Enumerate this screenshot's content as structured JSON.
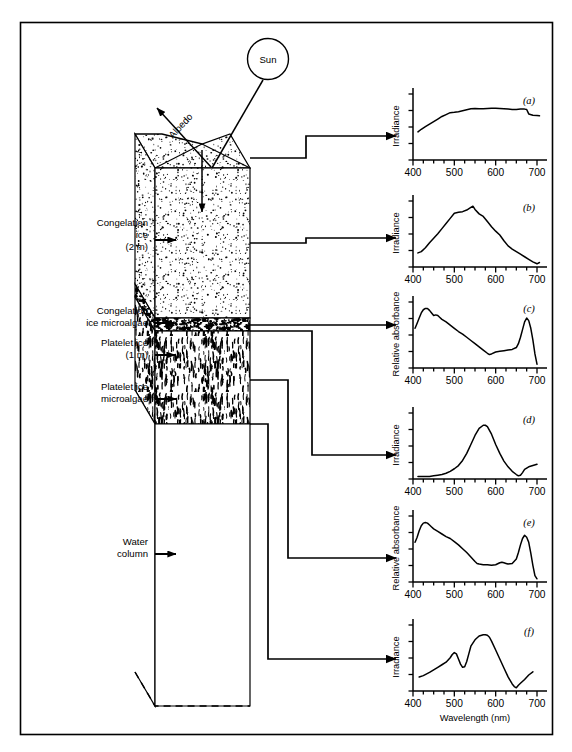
{
  "figure": {
    "border_color": "#000000",
    "background": "#ffffff"
  },
  "diagram": {
    "sun_label": "Sun",
    "albedo_label": "Albedo",
    "layers": [
      {
        "id": "congelation-ice",
        "line1": "Congelation",
        "line2": "ice",
        "line3": "(2 m)"
      },
      {
        "id": "congelation-ice-microalgae",
        "line1": "Congelation",
        "line2": "ice microalgae",
        "line3": ""
      },
      {
        "id": "platelet-ice",
        "line1": "Platelet ice",
        "line2": "(1 m)",
        "line3": ""
      },
      {
        "id": "platelet-ice-microalgae",
        "line1": "Platelet ice",
        "line2": "microalgae",
        "line3": ""
      },
      {
        "id": "water-column",
        "line1": "Water",
        "line2": "column",
        "line3": ""
      }
    ]
  },
  "axis": {
    "xlabel": "Wavelength (nm)",
    "xticks": [
      400,
      500,
      600,
      700
    ],
    "xtick_labels": [
      "400",
      "500",
      "600",
      "700"
    ],
    "xlim": [
      400,
      710
    ],
    "minor_tick_step": 25
  },
  "chart_data": [
    {
      "id": "a",
      "type": "line",
      "panel_label": "(a)",
      "ylabel": "Irradiance",
      "xlabel": "Wavelength (nm)",
      "xlim": [
        400,
        710
      ],
      "ylim": [
        0,
        1
      ],
      "grid": false,
      "legend": "none",
      "x": [
        412,
        420,
        430,
        440,
        450,
        460,
        470,
        480,
        490,
        500,
        510,
        520,
        530,
        540,
        550,
        560,
        570,
        580,
        590,
        600,
        610,
        620,
        630,
        640,
        650,
        660,
        670,
        675,
        680,
        690,
        700,
        706
      ],
      "y": [
        0.44,
        0.48,
        0.52,
        0.56,
        0.6,
        0.64,
        0.68,
        0.71,
        0.74,
        0.745,
        0.755,
        0.77,
        0.785,
        0.8,
        0.805,
        0.8,
        0.8,
        0.805,
        0.81,
        0.81,
        0.805,
        0.8,
        0.795,
        0.79,
        0.79,
        0.795,
        0.795,
        0.79,
        0.72,
        0.7,
        0.695,
        0.69
      ]
    },
    {
      "id": "b",
      "type": "line",
      "panel_label": "(b)",
      "ylabel": "Irradiance",
      "xlabel": "Wavelength (nm)",
      "xlim": [
        400,
        710
      ],
      "ylim": [
        0,
        1
      ],
      "grid": false,
      "legend": "none",
      "x": [
        412,
        420,
        430,
        440,
        450,
        460,
        470,
        480,
        490,
        500,
        510,
        520,
        530,
        540,
        545,
        550,
        560,
        570,
        580,
        590,
        600,
        610,
        620,
        630,
        640,
        650,
        660,
        670,
        680,
        690,
        700,
        706
      ],
      "y": [
        0.22,
        0.24,
        0.3,
        0.38,
        0.45,
        0.52,
        0.6,
        0.68,
        0.76,
        0.84,
        0.855,
        0.865,
        0.89,
        0.93,
        0.95,
        0.9,
        0.83,
        0.79,
        0.71,
        0.63,
        0.56,
        0.5,
        0.41,
        0.33,
        0.28,
        0.24,
        0.2,
        0.16,
        0.12,
        0.08,
        0.05,
        0.07
      ]
    },
    {
      "id": "c",
      "type": "line",
      "panel_label": "(c)",
      "ylabel": "Relative absorbance",
      "xlabel": "Wavelength (nm)",
      "xlim": [
        400,
        710
      ],
      "ylim": [
        0,
        1
      ],
      "grid": false,
      "legend": "none",
      "x": [
        405,
        410,
        415,
        420,
        425,
        430,
        435,
        440,
        445,
        450,
        455,
        460,
        465,
        470,
        480,
        490,
        500,
        510,
        520,
        530,
        540,
        550,
        560,
        570,
        580,
        585,
        590,
        600,
        610,
        620,
        630,
        640,
        650,
        655,
        660,
        665,
        670,
        675,
        680,
        685,
        690,
        695,
        700
      ],
      "y": [
        0.62,
        0.7,
        0.78,
        0.86,
        0.91,
        0.93,
        0.93,
        0.9,
        0.86,
        0.82,
        0.83,
        0.82,
        0.79,
        0.76,
        0.72,
        0.67,
        0.62,
        0.57,
        0.53,
        0.48,
        0.43,
        0.38,
        0.33,
        0.28,
        0.23,
        0.21,
        0.22,
        0.25,
        0.26,
        0.27,
        0.28,
        0.29,
        0.32,
        0.38,
        0.48,
        0.6,
        0.72,
        0.78,
        0.74,
        0.62,
        0.44,
        0.22,
        0.06
      ]
    },
    {
      "id": "d",
      "type": "line",
      "panel_label": "(d)",
      "ylabel": "Irradiance",
      "xlabel": "Wavelength (nm)",
      "xlim": [
        400,
        710
      ],
      "ylim": [
        0,
        1
      ],
      "grid": false,
      "legend": "none",
      "x": [
        412,
        425,
        440,
        450,
        460,
        470,
        480,
        490,
        500,
        510,
        520,
        530,
        540,
        550,
        560,
        570,
        575,
        580,
        590,
        600,
        610,
        620,
        630,
        640,
        650,
        655,
        660,
        665,
        670,
        680,
        690,
        700
      ],
      "y": [
        0.04,
        0.04,
        0.04,
        0.05,
        0.06,
        0.07,
        0.09,
        0.12,
        0.16,
        0.21,
        0.29,
        0.4,
        0.54,
        0.68,
        0.79,
        0.84,
        0.84,
        0.82,
        0.7,
        0.54,
        0.4,
        0.28,
        0.19,
        0.12,
        0.07,
        0.05,
        0.06,
        0.1,
        0.15,
        0.19,
        0.21,
        0.23
      ]
    },
    {
      "id": "e",
      "type": "line",
      "panel_label": "(e)",
      "ylabel": "Relative absorbance",
      "xlabel": "Wavelength (nm)",
      "xlim": [
        400,
        710
      ],
      "ylim": [
        0,
        1
      ],
      "grid": false,
      "legend": "none",
      "x": [
        405,
        410,
        415,
        420,
        425,
        430,
        435,
        440,
        445,
        450,
        460,
        470,
        480,
        490,
        500,
        510,
        520,
        530,
        540,
        550,
        555,
        560,
        570,
        580,
        590,
        600,
        610,
        615,
        620,
        625,
        630,
        640,
        650,
        655,
        660,
        665,
        670,
        675,
        680,
        685,
        690,
        695,
        700
      ],
      "y": [
        0.62,
        0.7,
        0.8,
        0.88,
        0.92,
        0.93,
        0.92,
        0.89,
        0.86,
        0.83,
        0.79,
        0.75,
        0.71,
        0.68,
        0.63,
        0.58,
        0.52,
        0.46,
        0.39,
        0.32,
        0.29,
        0.28,
        0.27,
        0.27,
        0.26,
        0.27,
        0.3,
        0.31,
        0.3,
        0.29,
        0.28,
        0.29,
        0.36,
        0.46,
        0.58,
        0.68,
        0.73,
        0.7,
        0.62,
        0.45,
        0.26,
        0.1,
        0.05
      ]
    },
    {
      "id": "f",
      "type": "line",
      "panel_label": "(f)",
      "ylabel": "Irradiance",
      "xlabel": "Wavelength (nm)",
      "xlim": [
        400,
        710
      ],
      "ylim": [
        0,
        1
      ],
      "grid": false,
      "legend": "none",
      "x": [
        415,
        425,
        440,
        450,
        460,
        470,
        480,
        490,
        495,
        500,
        505,
        510,
        515,
        520,
        525,
        530,
        535,
        540,
        550,
        560,
        570,
        575,
        580,
        585,
        590,
        600,
        610,
        620,
        630,
        640,
        645,
        650,
        655,
        660,
        670,
        680,
        690
      ],
      "y": [
        0.22,
        0.24,
        0.29,
        0.33,
        0.37,
        0.41,
        0.45,
        0.52,
        0.57,
        0.6,
        0.58,
        0.5,
        0.42,
        0.37,
        0.38,
        0.46,
        0.58,
        0.7,
        0.8,
        0.86,
        0.88,
        0.88,
        0.87,
        0.84,
        0.78,
        0.64,
        0.5,
        0.36,
        0.22,
        0.11,
        0.07,
        0.05,
        0.09,
        0.12,
        0.18,
        0.25,
        0.3
      ]
    }
  ]
}
